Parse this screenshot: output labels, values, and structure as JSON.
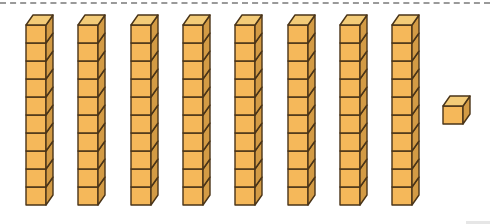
{
  "diagram": {
    "rods": {
      "count": 8,
      "cubes_per_rod": 10,
      "label": "ten-rod"
    },
    "units": {
      "count": 1,
      "label": "unit-cube"
    },
    "represented_value": 81,
    "colors": {
      "front": "#F5B85A",
      "side": "#D39B45",
      "top": "#F3CB78",
      "outline": "#4A3418",
      "dash_line": "#9A9A9A"
    }
  }
}
